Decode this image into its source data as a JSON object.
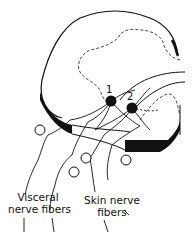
{
  "diagram": {
    "neurons": [
      {
        "id": "neuron-1",
        "label": "1"
      },
      {
        "id": "neuron-2",
        "label": "2"
      }
    ],
    "labels": {
      "visceral_line1": "Visceral",
      "visceral_line2": "nerve fibers",
      "skin_line1": "Skin nerve",
      "skin_line2": "fibers"
    },
    "colors": {
      "ink": "#111111",
      "background": "#ffffff"
    }
  }
}
